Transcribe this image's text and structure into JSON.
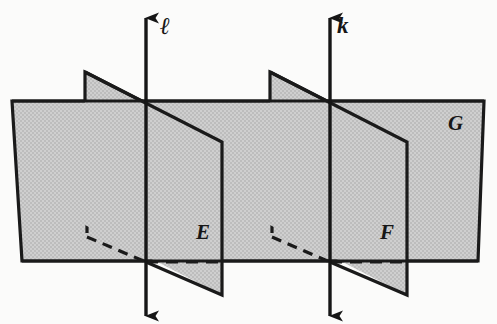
{
  "figure": {
    "type": "geometry-diagram",
    "width": 497,
    "height": 324,
    "background_color": "#fbfbfa",
    "plane_fill_color": "#c9c9c9",
    "stroke_color": "#1a1a1a"
  },
  "labels": {
    "line_l": "ℓ",
    "line_k": "k",
    "plane_e": "E",
    "plane_f": "F",
    "plane_g": "G"
  },
  "geometry": {
    "plane_g": {
      "name": "G",
      "kind": "horizontal-plane",
      "points": "12,101 484,101 478,261 22,261"
    },
    "plane_e": {
      "name": "E",
      "kind": "vertical-plane",
      "points": "85,72 222,142 222,295 85,225"
    },
    "plane_f": {
      "name": "F",
      "kind": "vertical-plane",
      "points": "270,72 407,142 407,295 270,225"
    },
    "line_l": {
      "name": "l",
      "x": 146,
      "top_y": 18,
      "bottom_y": 316,
      "pierce_top": 101,
      "pierce_bottom": 262
    },
    "line_k": {
      "name": "k",
      "x": 330,
      "top_y": 18,
      "bottom_y": 316,
      "pierce_top": 101,
      "pierce_bottom": 262
    },
    "hidden_edges": [
      {
        "name": "plane-e-hidden-left",
        "d": "M 87,104 L 87,237"
      },
      {
        "name": "plane-e-hidden-bottom",
        "d": "M 87,237 L 146,262"
      },
      {
        "name": "plane-e-hidden-base",
        "d": "M 146,262 L 222,262"
      },
      {
        "name": "plane-f-hidden-left",
        "d": "M 272,104 L 272,237"
      },
      {
        "name": "plane-f-hidden-bottom",
        "d": "M 272,237 L 330,262"
      },
      {
        "name": "plane-f-hidden-base",
        "d": "M 330,262 L 407,262"
      }
    ]
  }
}
